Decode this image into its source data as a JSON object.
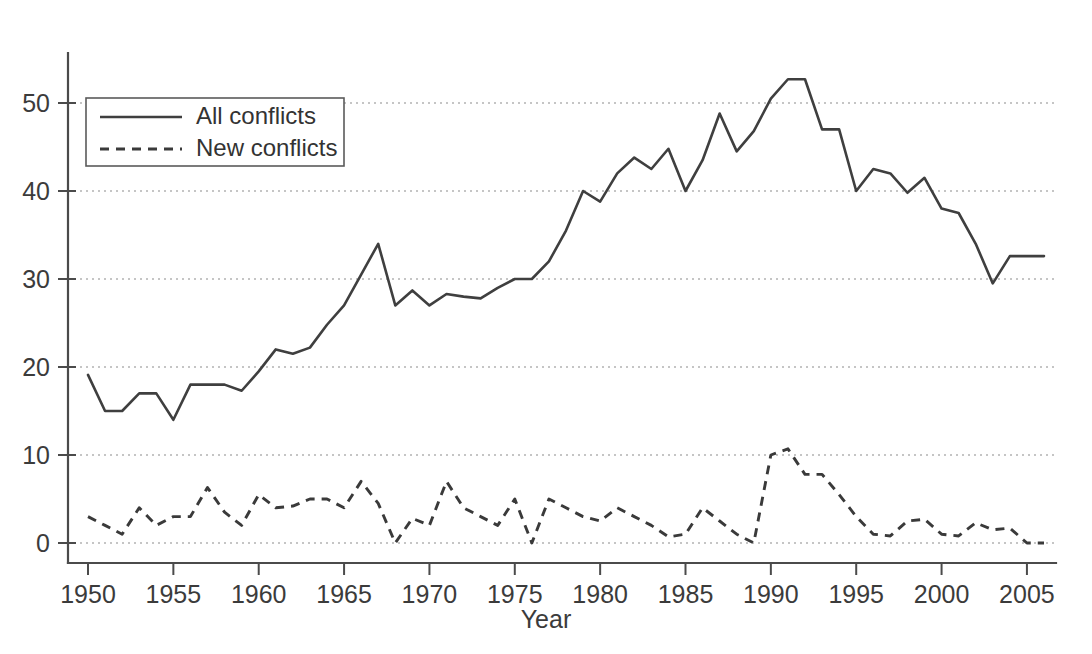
{
  "chart_data": {
    "type": "line",
    "title": "",
    "xlabel": "Year",
    "ylabel": "",
    "xlim": [
      1950,
      2006
    ],
    "ylim": [
      0,
      55
    ],
    "grid": true,
    "legend_position": "top-left",
    "x_ticks": [
      1950,
      1955,
      1960,
      1965,
      1970,
      1975,
      1980,
      1985,
      1990,
      1995,
      2000,
      2005
    ],
    "y_ticks": [
      0,
      10,
      20,
      30,
      40,
      50
    ],
    "x": [
      1950,
      1951,
      1952,
      1953,
      1954,
      1955,
      1956,
      1957,
      1958,
      1959,
      1960,
      1961,
      1962,
      1963,
      1964,
      1965,
      1966,
      1967,
      1968,
      1969,
      1970,
      1971,
      1972,
      1973,
      1974,
      1975,
      1976,
      1977,
      1978,
      1979,
      1980,
      1981,
      1982,
      1983,
      1984,
      1985,
      1986,
      1987,
      1988,
      1989,
      1990,
      1991,
      1992,
      1993,
      1994,
      1995,
      1996,
      1997,
      1998,
      1999,
      2000,
      2001,
      2002,
      2003,
      2004,
      2005,
      2006
    ],
    "series": [
      {
        "name": "All conflicts",
        "style": "solid",
        "color": "#3f3f3f",
        "values": [
          19.1,
          15.0,
          15.0,
          17.0,
          17.0,
          14.0,
          18.0,
          18.0,
          18.0,
          17.3,
          19.5,
          22.0,
          21.5,
          22.2,
          24.8,
          27.0,
          30.5,
          34.0,
          27.0,
          28.7,
          27.0,
          28.3,
          28.0,
          27.8,
          29.0,
          30.0,
          30.0,
          32.0,
          35.5,
          40.0,
          38.8,
          42.0,
          43.8,
          42.5,
          44.8,
          40.0,
          43.5,
          48.8,
          44.5,
          46.8,
          50.5,
          52.7,
          52.7,
          47.0,
          47.0,
          40.0,
          42.5,
          42.0,
          39.8,
          41.5,
          38.0,
          37.5,
          34.0,
          29.5,
          32.6,
          32.6,
          32.6
        ]
      },
      {
        "name": "New conflicts",
        "style": "dashed",
        "color": "#3a3a3a",
        "values": [
          3.0,
          2.0,
          1.0,
          4.0,
          2.0,
          3.0,
          3.0,
          6.3,
          3.5,
          2.0,
          5.5,
          4.0,
          4.2,
          5.0,
          5.0,
          4.0,
          7.0,
          4.5,
          0.0,
          2.8,
          2.0,
          7.0,
          4.0,
          3.0,
          2.0,
          5.0,
          0.0,
          5.0,
          4.0,
          3.0,
          2.5,
          4.0,
          3.0,
          2.0,
          0.7,
          1.0,
          4.0,
          2.5,
          1.0,
          0.0,
          10.0,
          10.7,
          7.8,
          7.8,
          5.5,
          3.0,
          1.0,
          0.8,
          2.5,
          2.7,
          1.0,
          0.8,
          2.3,
          1.5,
          1.7,
          0.0,
          0.0
        ]
      }
    ]
  },
  "axis": {
    "x_title": "Year",
    "x_tick_labels": [
      "1950",
      "1955",
      "1960",
      "1965",
      "1970",
      "1975",
      "1980",
      "1985",
      "1990",
      "1995",
      "2000",
      "2005"
    ],
    "y_tick_labels": [
      "0",
      "10",
      "20",
      "30",
      "40",
      "50"
    ]
  },
  "legend": {
    "entries": [
      {
        "label": "All conflicts",
        "style": "solid"
      },
      {
        "label": "New conflicts",
        "style": "dashed"
      }
    ]
  },
  "colors": {
    "line": "#3f3f3f",
    "grid": "#8c8c8c",
    "axis": "#4b4b4b",
    "text": "#3b3b3b",
    "background": "#ffffff"
  }
}
